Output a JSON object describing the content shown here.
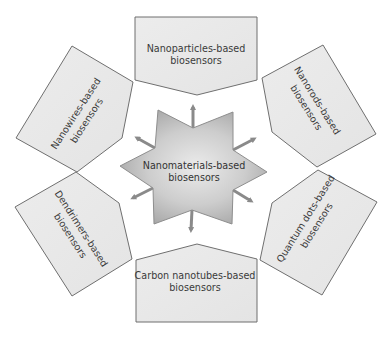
{
  "figure": {
    "center": {
      "line1": "Nanomaterials-based",
      "line2": "biosensors",
      "shape": "six-pointed-star"
    },
    "nodes": [
      {
        "id": "nanoparticles",
        "position": "top",
        "line1": "Nanoparticles-based",
        "line2": "biosensors"
      },
      {
        "id": "nanorods",
        "position": "upper-right",
        "line1": "Nanorods-based",
        "line2": "biosensors"
      },
      {
        "id": "quantum-dots",
        "position": "lower-right",
        "line1": "Quantum dots-based",
        "line2": "biosensors"
      },
      {
        "id": "carbon-nanotubes",
        "position": "bottom",
        "line1": "Carbon nanotubes-based",
        "line2": "biosensors"
      },
      {
        "id": "dendrimers",
        "position": "lower-left",
        "line1": "Dendrimers-based",
        "line2": "biosensors"
      },
      {
        "id": "nanowires",
        "position": "upper-left",
        "line1": "Nanowires-based",
        "line2": "biosensors"
      }
    ],
    "arrow_count": 6
  },
  "colors": {
    "panel_fill": "#e9e9e9",
    "panel_stroke": "#6f6f6f",
    "star_center": "#e6e6e6",
    "star_edge": "#a3a3a3",
    "arrow": "#8a8a8a",
    "text": "#3a3a3a",
    "background": "#ffffff"
  }
}
